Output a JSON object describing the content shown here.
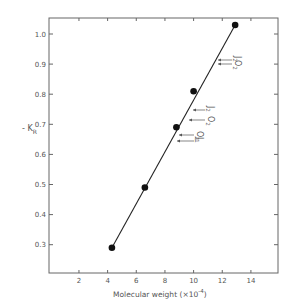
{
  "chart_data": {
    "type": "line",
    "title": "",
    "xlabel": "Molecular weight (×10⁻⁴)",
    "ylabel": "-K_R",
    "xlim": [
      0,
      15.5
    ],
    "ylim": [
      0.2,
      1.05
    ],
    "x_ticks": [
      2,
      4,
      6,
      8,
      10,
      12,
      14
    ],
    "y_ticks": [
      0.3,
      0.4,
      0.5,
      0.6,
      0.7,
      0.8,
      0.9,
      1.0
    ],
    "y_tick_labels": [
      "0.3",
      "0.4",
      "0.5",
      "0.6",
      "0.7",
      "0.8",
      "0.9",
      "1.0"
    ],
    "grid": false,
    "legend": null,
    "series": [
      {
        "name": "data",
        "marker": "filled-circle",
        "line": "straight-fit",
        "x": [
          4.3,
          6.6,
          8.8,
          10.0,
          12.9
        ],
        "y": [
          0.29,
          0.49,
          0.69,
          0.81,
          1.03
        ]
      }
    ],
    "fit_line": {
      "x": [
        4.3,
        12.9
      ],
      "y": [
        0.29,
        1.03
      ]
    },
    "annotations": [
      {
        "label": "J2",
        "y": 0.91,
        "arrow": "left"
      },
      {
        "label": "O2",
        "y": 0.89,
        "arrow": "left"
      },
      {
        "label": "J2",
        "y": 0.74,
        "arrow": "left"
      },
      {
        "label": "O2",
        "y": 0.71,
        "arrow": "left"
      },
      {
        "label": "O1",
        "y": 0.66,
        "arrow": "left"
      },
      {
        "label": "J1",
        "y": 0.645,
        "arrow": "left"
      }
    ]
  },
  "labels": {
    "ylabel_main": "- K",
    "ylabel_sub": "R",
    "xlabel_text": "Molecular  weight  (×10",
    "xlabel_exp": "-4",
    "xlabel_close": ")"
  }
}
